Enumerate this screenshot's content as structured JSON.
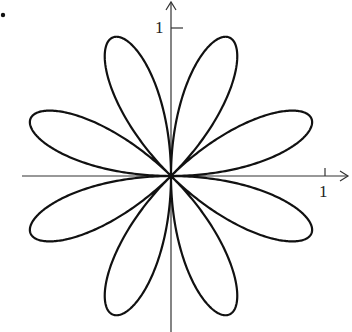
{
  "chart_data": {
    "type": "line",
    "title": "",
    "equation": "r = sin(4θ)",
    "petals": 8,
    "petal_angles_deg": [
      22.5,
      67.5,
      112.5,
      157.5,
      202.5,
      247.5,
      292.5,
      337.5
    ],
    "max_radius": 1,
    "xlabel": "",
    "ylabel": "",
    "x_ticks": [
      "1"
    ],
    "y_ticks": [
      "1"
    ],
    "xlim": [
      -1,
      1.1
    ],
    "ylim": [
      -1,
      1.15
    ],
    "grid": false
  },
  "labels": {
    "x_tick": "1",
    "y_tick": "1",
    "marker": "•"
  },
  "colors": {
    "curve": "#111111",
    "axes": "#333333"
  }
}
